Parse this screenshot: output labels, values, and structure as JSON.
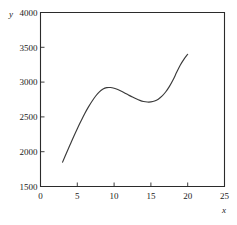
{
  "chart_data": {
    "type": "line",
    "title": "",
    "subtitle": "",
    "xlabel": "x",
    "ylabel": "y",
    "xlim": [
      0,
      25
    ],
    "ylim": [
      1500,
      4000
    ],
    "xticks": [
      0,
      5,
      10,
      15,
      20,
      25
    ],
    "yticks": [
      1500,
      2000,
      2500,
      3000,
      3500,
      4000
    ],
    "xtick_labels": [
      "0",
      "5",
      "10",
      "15",
      "20",
      "25"
    ],
    "ytick_labels": [
      "1500",
      "2000",
      "2500",
      "3000",
      "3500",
      "4000"
    ],
    "grid": false,
    "legend": null,
    "legend_position": "none",
    "annotations": [],
    "series": [
      {
        "name": "curve",
        "color": "#3a3a3a",
        "x": [
          3.0,
          3.5,
          4.0,
          4.5,
          5.0,
          5.5,
          6.0,
          6.5,
          7.0,
          7.5,
          8.0,
          8.5,
          9.0,
          9.5,
          10.0,
          10.5,
          11.0,
          11.5,
          12.0,
          12.5,
          13.0,
          13.5,
          14.0,
          14.5,
          15.0,
          15.5,
          16.0,
          16.5,
          17.0,
          17.5,
          18.0,
          18.5,
          19.0,
          19.5,
          20.0
        ],
        "y": [
          1850,
          1975,
          2095,
          2215,
          2330,
          2440,
          2545,
          2640,
          2725,
          2800,
          2860,
          2900,
          2920,
          2922,
          2912,
          2893,
          2868,
          2840,
          2812,
          2785,
          2760,
          2738,
          2722,
          2714,
          2715,
          2728,
          2755,
          2798,
          2858,
          2935,
          3030,
          3140,
          3245,
          3330,
          3400
        ]
      }
    ],
    "curve_features": {
      "start_point": [
        3,
        1850
      ],
      "local_maximum": [
        9.5,
        2922
      ],
      "local_minimum": [
        14.5,
        2714
      ],
      "end_point": [
        20,
        3400
      ]
    }
  },
  "axes": {
    "y_axis_name": "y",
    "x_axis_name": "x"
  },
  "colors": {
    "curve": "#3a3a3a",
    "frame": "#2b2b2b",
    "background": "#ffffff",
    "text": "#1a1a1a"
  }
}
